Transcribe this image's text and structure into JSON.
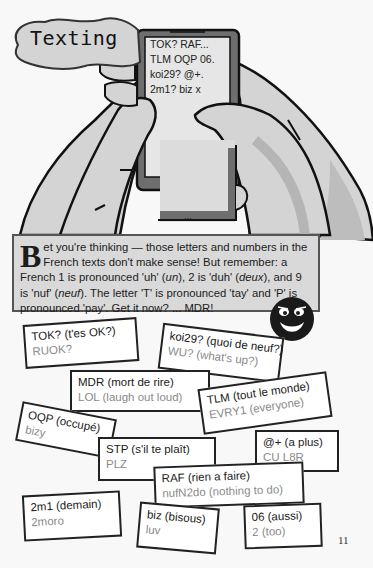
{
  "title": "Texting",
  "phone_screen": {
    "lines": [
      "TOK? RAF...",
      "TLM OQP 06.",
      "koi29? @+.",
      "2m1? biz x"
    ],
    "button_label": "..."
  },
  "info_box": {
    "dropcap": "B",
    "text_parts": {
      "p1": "et you're thinking — those letters and numbers in the French texts don't make sense! But remember: a French 1 is pronounced 'uh' (",
      "p1_italic": "un",
      "p2": "), 2 is 'duh' (",
      "p2_italic": "deux",
      "p3": "), and 9 is 'nuf' (",
      "p3_italic": "neuf",
      "p4": "). The letter 'T' is pronounced 'tay' and 'P' is pronounced 'pay'. Get it now? ... MDR!"
    }
  },
  "smiley_icon": "grinning-face",
  "cards": [
    {
      "french": "TOK? (t'es OK?)",
      "english": "RUOK?"
    },
    {
      "french": "koi29? (quoi de neuf?)",
      "english": "WU? (what's up?)"
    },
    {
      "french": "MDR (mort de rire)",
      "english": "LOL (laugh out loud)"
    },
    {
      "french": "TLM (tout le monde)",
      "english": "EVRY1 (everyone)"
    },
    {
      "french": "OQP (occupé)",
      "english": "bizy"
    },
    {
      "french": "@+ (a plus)",
      "english": "CU L8R"
    },
    {
      "french": "STP (s'il te plaît)",
      "english": "PLZ"
    },
    {
      "french": "RAF (rien a faire)",
      "english": "nufN2do (nothing to do)"
    },
    {
      "french": "2m1 (demain)",
      "english": "2moro"
    },
    {
      "french": "biz (bisous)",
      "english": "luv"
    },
    {
      "french": "06 (aussi)",
      "english": "2 (too)"
    }
  ],
  "page_number": "11",
  "colors": {
    "skin": "#d4d4d4",
    "phone_frame": "#6e6e6e",
    "info_box_bg": "#d9d9d9",
    "card_border": "#222222",
    "english_text": "#8a8a8a"
  }
}
